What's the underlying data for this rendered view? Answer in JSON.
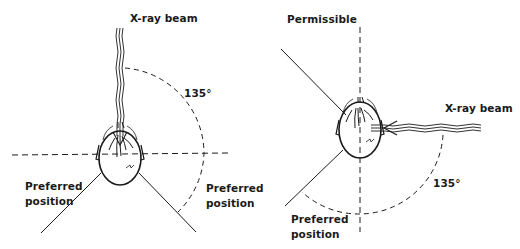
{
  "figure": {
    "left_panel": {
      "beam_label": "X-ray beam",
      "angle_label": "135°",
      "preferred_left_line1": "Preferred",
      "preferred_left_line2": "position",
      "preferred_right_line1": "Preferred",
      "preferred_right_line2": "position",
      "beam_direction": "from-top"
    },
    "right_panel": {
      "permissible_label": "Permissible",
      "beam_label": "X-ray beam",
      "angle_label": "135°",
      "preferred_line1": "Preferred",
      "preferred_line2": "position",
      "beam_direction": "from-right"
    },
    "colors": {
      "ink": "#1a1a1a",
      "background": "#ffffff"
    }
  }
}
